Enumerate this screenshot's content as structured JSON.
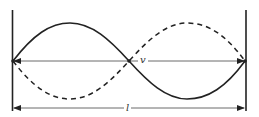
{
  "diagram": {
    "type": "standing-wave",
    "wave_solid": "sin(x) half-period up then down",
    "wave_dashed": "inverse phase",
    "labels": {
      "velocity": "v",
      "length": "l"
    },
    "colors": {
      "line": "#222222",
      "background": "#ffffff"
    }
  }
}
